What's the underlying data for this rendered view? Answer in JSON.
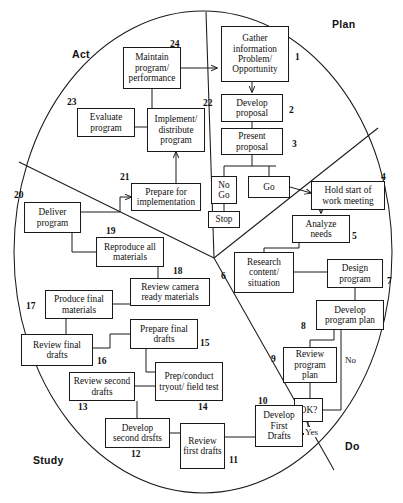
{
  "diagram": {
    "quadrants": [
      {
        "name": "plan",
        "label": "Plan",
        "x": 332,
        "y": 18
      },
      {
        "name": "act",
        "label": "Act",
        "x": 72,
        "y": 48
      },
      {
        "name": "study",
        "label": "Study",
        "x": 33,
        "y": 454
      },
      {
        "name": "do",
        "label": "Do",
        "x": 345,
        "y": 440
      }
    ],
    "nodes": [
      {
        "id": "n1",
        "num": "1",
        "text": "Gather information Problem/ Opportunity",
        "x": 221,
        "y": 26,
        "w": 68,
        "h": 56,
        "numx": 295,
        "numy": 52
      },
      {
        "id": "n2",
        "num": "2",
        "text": "Develop proposal",
        "x": 221,
        "y": 94,
        "w": 62,
        "h": 28,
        "numx": 289,
        "numy": 105
      },
      {
        "id": "n3",
        "num": "3",
        "text": "Present proposal",
        "x": 221,
        "y": 128,
        "w": 62,
        "h": 27,
        "numx": 292,
        "numy": 139
      },
      {
        "id": "nogo",
        "num": "",
        "text": "No Go",
        "x": 211,
        "y": 176,
        "w": 26,
        "h": 28,
        "numx": 0,
        "numy": 0
      },
      {
        "id": "go",
        "num": "",
        "text": "Go",
        "x": 248,
        "y": 176,
        "w": 42,
        "h": 22,
        "numx": 0,
        "numy": 0
      },
      {
        "id": "stop",
        "num": "",
        "text": "Stop",
        "x": 208,
        "y": 211,
        "w": 32,
        "h": 17,
        "numx": 0,
        "numy": 0
      },
      {
        "id": "n4",
        "num": "4",
        "text": "Hold start of work meeting",
        "x": 311,
        "y": 181,
        "w": 74,
        "h": 29,
        "numx": 381,
        "numy": 172
      },
      {
        "id": "n5",
        "num": "5",
        "text": "Analyze needs",
        "x": 292,
        "y": 215,
        "w": 58,
        "h": 28,
        "numx": 352,
        "numy": 231
      },
      {
        "id": "n6",
        "num": "6",
        "text": "Research content/ situation",
        "x": 234,
        "y": 252,
        "w": 60,
        "h": 41,
        "numx": 221,
        "numy": 271
      },
      {
        "id": "n7",
        "num": "7",
        "text": "Design program",
        "x": 327,
        "y": 259,
        "w": 56,
        "h": 29,
        "numx": 387,
        "numy": 276
      },
      {
        "id": "n8",
        "num": "8",
        "text": "Develop program plan",
        "x": 316,
        "y": 300,
        "w": 68,
        "h": 30,
        "numx": 301,
        "numy": 321
      },
      {
        "id": "n9",
        "num": "9",
        "text": "Review program plan",
        "x": 283,
        "y": 347,
        "w": 54,
        "h": 36,
        "numx": 271,
        "numy": 354
      },
      {
        "id": "ok",
        "num": "",
        "text": "OK?",
        "x": 294,
        "y": 398,
        "w": 29,
        "h": 24,
        "numx": 0,
        "numy": 0
      },
      {
        "id": "n10",
        "num": "10",
        "text": "Develop First Drafts",
        "x": 255,
        "y": 405,
        "w": 48,
        "h": 42,
        "numx": 258,
        "numy": 396
      },
      {
        "id": "n11",
        "num": "11",
        "text": "Review first drafts",
        "x": 180,
        "y": 423,
        "w": 45,
        "h": 46,
        "numx": 229,
        "numy": 467
      },
      {
        "id": "n12",
        "num": "12",
        "text": "Develop second drsfts",
        "x": 105,
        "y": 418,
        "w": 65,
        "h": 30,
        "numx": 131,
        "numy": 459
      },
      {
        "id": "n13",
        "num": "13",
        "text": "Review second drafts",
        "x": 69,
        "y": 372,
        "w": 66,
        "h": 29,
        "numx": 78,
        "numy": 412
      },
      {
        "id": "n14",
        "num": "14",
        "text": "Prep/conduct tryout/ field test",
        "x": 155,
        "y": 362,
        "w": 68,
        "h": 39,
        "numx": 198,
        "numy": 412
      },
      {
        "id": "n15",
        "num": "15",
        "text": "Prepare final drafts",
        "x": 130,
        "y": 319,
        "w": 68,
        "h": 30,
        "numx": 207,
        "numy": 344
      },
      {
        "id": "n16",
        "num": "16",
        "text": "Review final drafts",
        "x": 21,
        "y": 334,
        "w": 72,
        "h": 32,
        "numx": 97,
        "numy": 360
      },
      {
        "id": "n17",
        "num": "17",
        "text": "Produce final materials",
        "x": 45,
        "y": 290,
        "w": 68,
        "h": 29,
        "numx": 24,
        "numy": 308
      },
      {
        "id": "n18",
        "num": "18",
        "text": "Review camera ready materials",
        "x": 130,
        "y": 278,
        "w": 80,
        "h": 28,
        "numx": 178,
        "numy": 270
      },
      {
        "id": "n19",
        "num": "19",
        "text": "Reproduce all materials",
        "x": 96,
        "y": 237,
        "w": 68,
        "h": 30,
        "numx": 106,
        "numy": 230
      },
      {
        "id": "n20",
        "num": "20",
        "text": "Deliver program",
        "x": 24,
        "y": 202,
        "w": 57,
        "h": 31,
        "numx": 14,
        "numy": 191
      },
      {
        "id": "n21",
        "num": "21",
        "text": "Prepare for implementation",
        "x": 131,
        "y": 183,
        "w": 70,
        "h": 28,
        "numx": 120,
        "numy": 176
      },
      {
        "id": "n22",
        "num": "22",
        "text": "Implement/ distribute program",
        "x": 147,
        "y": 108,
        "w": 58,
        "h": 44,
        "numx": 205,
        "numy": 100
      },
      {
        "id": "n23",
        "num": "23",
        "text": "Evaluate program",
        "x": 77,
        "y": 108,
        "w": 58,
        "h": 29,
        "numx": 67,
        "numy": 99
      },
      {
        "id": "n24",
        "num": "24",
        "text": "Maintain program/ performance",
        "x": 123,
        "y": 47,
        "w": 58,
        "h": 42,
        "numx": 170,
        "numy": 41
      }
    ],
    "edge_labels": [
      {
        "name": "no-label",
        "text": "No",
        "x": 348,
        "y": 360
      },
      {
        "name": "yes-label",
        "text": "Yes",
        "x": 304,
        "y": 428
      }
    ]
  }
}
